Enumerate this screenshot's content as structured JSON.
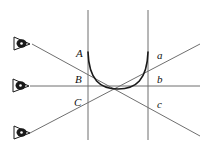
{
  "figure": {
    "background_color": "#ffffff",
    "line_color": "#6f6f6f",
    "curve_color": "#1a1a1a",
    "label_color": "#111111",
    "width": 224,
    "height": 147
  },
  "observers": [
    {
      "id": "eye-top",
      "name": "eye-top",
      "glyph": "eye-icon",
      "x": 22,
      "y": 40,
      "ray_end_x": 200,
      "ray_end_y": 136
    },
    {
      "id": "eye-middle",
      "name": "eye-middle",
      "glyph": "eye-icon",
      "x": 18,
      "y": 86,
      "ray_end_x": 200,
      "ray_end_y": 86
    },
    {
      "id": "eye-bottom",
      "name": "eye-bottom",
      "glyph": "eye-icon",
      "x": 22,
      "y": 131,
      "ray_end_x": 200,
      "ray_end_y": 44
    }
  ],
  "vertical_lines": [
    {
      "id": "left-vertical",
      "x": 88,
      "y_top": 10,
      "y_bottom": 140
    },
    {
      "id": "right-vertical",
      "x": 148,
      "y_top": 10,
      "y_bottom": 140
    }
  ],
  "curve": {
    "id": "concave-arc",
    "description": "U-shaped concave curve",
    "start_x": 88,
    "start_y": 52,
    "end_x": 148,
    "end_y": 52,
    "vertex_x": 118,
    "vertex_y": 89
  },
  "labels": {
    "left": [
      {
        "text": "A",
        "x": 76,
        "y": 48
      },
      {
        "text": "B",
        "x": 75,
        "y": 74
      },
      {
        "text": "C",
        "x": 74,
        "y": 97
      }
    ],
    "right": [
      {
        "text": "a",
        "x": 157,
        "y": 50
      },
      {
        "text": "b",
        "x": 157,
        "y": 74
      },
      {
        "text": "c",
        "x": 157,
        "y": 99
      }
    ]
  }
}
